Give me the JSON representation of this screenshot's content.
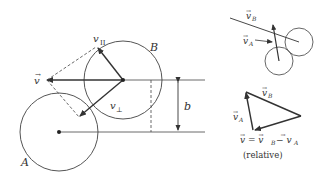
{
  "diagram": {
    "labels": {
      "circle_a": "A",
      "circle_b": "B",
      "v": "v",
      "v_parallel": "v",
      "v_parallel_sub": "II",
      "v_perp": "v",
      "v_perp_sub": "⊥",
      "impact_parameter": "b",
      "inset_vb": "v",
      "inset_vb_sub": "B",
      "inset_va": "v",
      "inset_va_sub": "A",
      "tri_vb": "v",
      "tri_vb_sub": "B",
      "tri_va": "v",
      "tri_va_sub": "A",
      "relation": "v = v",
      "relation_b": "B",
      "relation_minus": " − v",
      "relation_a": "A",
      "relative_caption": "(relative)",
      "vec_arrow": "⃗"
    },
    "colors": {
      "stroke": "#333333",
      "circle_stroke": "#555555",
      "background": "#ffffff"
    }
  }
}
